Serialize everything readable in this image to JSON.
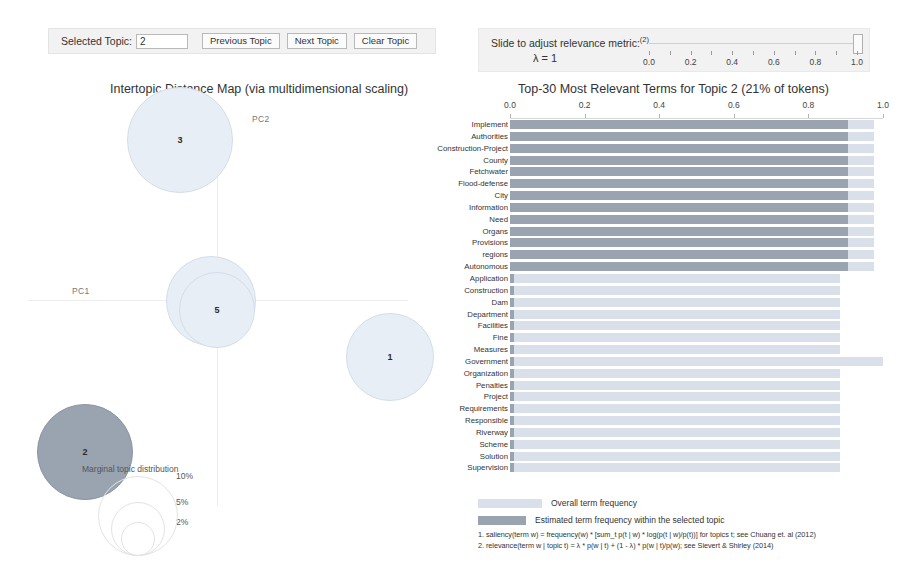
{
  "topic_control": {
    "label": "Selected Topic:",
    "value": "2",
    "placeholder": "",
    "previous_label": "Previous Topic",
    "next_label": "Next Topic",
    "clear_label": "Clear Topic"
  },
  "lambda_control": {
    "title": "Slide to adjust relevance metric:",
    "title_superscript": "(2)",
    "value_text": "λ = 1",
    "handle_value": 1.0,
    "ticks": [
      0.0,
      0.1,
      0.2,
      0.3,
      0.4,
      0.5,
      0.6,
      0.7,
      0.8,
      0.9,
      1.0
    ],
    "tick_labels": [
      "0.0",
      "0.2",
      "0.4",
      "0.6",
      "0.8",
      "1.0"
    ],
    "tick_label_values": [
      0.0,
      0.2,
      0.4,
      0.6,
      0.8,
      1.0
    ]
  },
  "intertopic_map": {
    "title": "Intertopic Distance Map (via multidimensional scaling)",
    "x_axis_label": "PC1",
    "y_axis_label": "PC2",
    "marginal_label": "Marginal topic distribution",
    "size_legend": [
      "2%",
      "5%",
      "10%"
    ],
    "selected_topic": 2,
    "colors": {
      "default_fill": "#e8eef5",
      "default_stroke": "#d4dde8",
      "selected_fill": "#9aa4b0",
      "selected_stroke": "#8b96a3"
    },
    "topics": [
      {
        "id": 3,
        "x": 160,
        "y": 40,
        "r": 53,
        "selected": false
      },
      {
        "id": 4,
        "x": 191,
        "y": 201,
        "r": 45,
        "selected": false
      },
      {
        "id": 5,
        "x": 197,
        "y": 210,
        "r": 38,
        "selected": false
      },
      {
        "id": 1,
        "x": 370,
        "y": 257,
        "r": 44,
        "selected": false
      },
      {
        "id": 2,
        "x": 65,
        "y": 352,
        "r": 48,
        "selected": true
      }
    ]
  },
  "bar_chart": {
    "title": "Top-30 Most Relevant Terms for Topic 2 (21% of tokens)",
    "topic_number": 2,
    "token_percent": "21%",
    "legend": [
      {
        "key": "overall",
        "label": "Overall term frequency",
        "color": "#d9e0ea"
      },
      {
        "key": "estimated",
        "label": "Estimated term frequency within the selected topic",
        "color": "#9aa4b0"
      }
    ],
    "footnotes": [
      "1. saliency(term w) = frequency(w) * [sum_t p(t | w) * log(p(t | w)/p(t))] for topics t; see Chuang et. al (2012)",
      "2. relevance(term w | topic t) = λ * p(w | t) + (1 - λ) * p(w | t)/p(w); see Sievert & Shirley (2014)"
    ]
  },
  "chart_data": {
    "type": "bar",
    "title": "Top-30 Most Relevant Terms for Topic 2 (21% of tokens)",
    "xlabel": "",
    "ylabel": "",
    "xlim": [
      0,
      1.0
    ],
    "xticks": [
      0.0,
      0.2,
      0.4,
      0.6,
      0.8,
      1.0
    ],
    "xtick_labels": [
      "0.0",
      "0.2",
      "0.4",
      "0.6",
      "0.8",
      "1.0"
    ],
    "grid": false,
    "legend_position": "bottom",
    "orientation": "horizontal",
    "stacked": true,
    "categories": [
      "Implement",
      "Authorities",
      "Construction-Project",
      "County",
      "Fetchwater",
      "Flood-defense",
      "City",
      "Information",
      "Need",
      "Organs",
      "Provisions",
      "regions",
      "Autonomous",
      "Application",
      "Construction",
      "Dam",
      "Department",
      "Facilities",
      "Fine",
      "Measures",
      "Government",
      "Organization",
      "Penalties",
      "Project",
      "Requirements",
      "Responsible",
      "Riverway",
      "Scheme",
      "Solution",
      "Supervision"
    ],
    "series": [
      {
        "name": "Overall term frequency",
        "color": "#d9e0ea",
        "values": [
          0.975,
          0.975,
          0.975,
          0.975,
          0.975,
          0.975,
          0.975,
          0.975,
          0.975,
          0.975,
          0.975,
          0.975,
          0.975,
          0.885,
          0.885,
          0.885,
          0.885,
          0.885,
          0.885,
          0.885,
          1.0,
          0.885,
          0.885,
          0.885,
          0.885,
          0.885,
          0.885,
          0.885,
          0.885,
          0.885
        ]
      },
      {
        "name": "Estimated term frequency within the selected topic",
        "color": "#9aa4b0",
        "values": [
          0.905,
          0.905,
          0.905,
          0.905,
          0.905,
          0.905,
          0.905,
          0.905,
          0.905,
          0.905,
          0.905,
          0.905,
          0.905,
          0.01,
          0.01,
          0.01,
          0.01,
          0.01,
          0.01,
          0.01,
          0.01,
          0.01,
          0.01,
          0.01,
          0.01,
          0.01,
          0.01,
          0.01,
          0.01,
          0.01
        ]
      }
    ]
  }
}
